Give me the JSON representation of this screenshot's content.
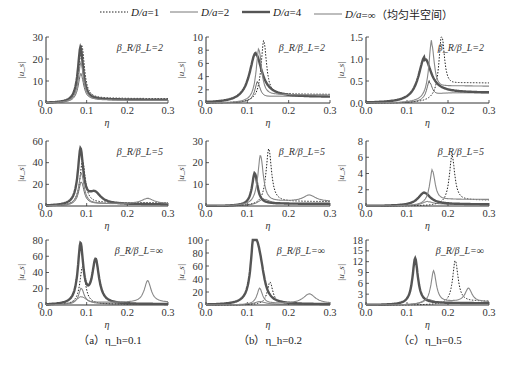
{
  "legend": [
    {
      "label_pre": "D/a",
      "label_post": "=1",
      "style": "dotted",
      "width": 1,
      "color": "#222222"
    },
    {
      "label_pre": "D/a",
      "label_post": "=2",
      "style": "solid",
      "width": 0.8,
      "color": "#555555"
    },
    {
      "label_pre": "D/a",
      "label_post": "=4",
      "style": "solid",
      "width": 2.4,
      "color": "#555555"
    },
    {
      "label_pre": "D/a",
      "label_post": "=∞（均匀半空间）",
      "style": "solid",
      "width": 1.1,
      "color": "#888888"
    }
  ],
  "captions": [
    "（a）η_h=0.1",
    "（b）η_h=0.2",
    "（c）η_h=0.5"
  ],
  "chart_data": [
    {
      "type": "line",
      "panel": "a-row1",
      "title": "β_R/β_L=2",
      "xlabel": "η",
      "ylabel": "|u_s|",
      "xlim": [
        0,
        0.3
      ],
      "ylim": [
        0,
        30
      ],
      "yticks": [
        0,
        10,
        20,
        30
      ],
      "xticks": [
        0.0,
        0.1,
        0.2,
        0.3
      ],
      "series": [
        {
          "name": "D/a=1",
          "peaks": [
            [
              0.088,
              26
            ]
          ],
          "tail": 2
        },
        {
          "name": "D/a=2",
          "peaks": [
            [
              0.086,
              13
            ]
          ],
          "tail": 1.5
        },
        {
          "name": "D/a=4",
          "peaks": [
            [
              0.085,
              25
            ]
          ],
          "tail": 1.5
        },
        {
          "name": "D/a=∞",
          "peaks": [
            [
              0.086,
              18
            ]
          ],
          "tail": 1.2
        }
      ]
    },
    {
      "type": "line",
      "panel": "b-row1",
      "title": "β_R/β_L=2",
      "xlabel": "η",
      "ylabel": "|u_s|",
      "xlim": [
        0,
        0.3
      ],
      "ylim": [
        0,
        10
      ],
      "yticks": [
        0,
        2,
        4,
        6,
        8,
        10
      ],
      "xticks": [
        0.0,
        0.1,
        0.2,
        0.3
      ],
      "series": [
        {
          "name": "D/a=1",
          "peaks": [
            [
              0.14,
              9.2
            ]
          ],
          "tail": 1.3
        },
        {
          "name": "D/a=2",
          "peaks": [
            [
              0.125,
              3.0
            ]
          ],
          "tail": 1.0
        },
        {
          "name": "D/a=4",
          "peaks": [
            [
              0.12,
              7.3
            ]
          ],
          "tail": 0.9
        },
        {
          "name": "D/a=∞",
          "peaks": [
            [
              0.128,
              8.0
            ]
          ],
          "tail": 1.2
        }
      ]
    },
    {
      "type": "line",
      "panel": "c-row1",
      "title": "β_R/β_L=2",
      "xlabel": "η",
      "ylabel": "|u_s|",
      "xlim": [
        0,
        0.3
      ],
      "ylim": [
        0,
        1.5
      ],
      "yticks": [
        0,
        0.5,
        1.0,
        1.5
      ],
      "xticks": [
        0.0,
        0.1,
        0.2,
        0.3
      ],
      "series": [
        {
          "name": "D/a=1",
          "peaks": [
            [
              0.185,
              1.48
            ]
          ],
          "tail": 0.45
        },
        {
          "name": "D/a=2",
          "peaks": [
            [
              0.155,
              0.45
            ]
          ],
          "tail": 0.23
        },
        {
          "name": "D/a=4",
          "peaks": [
            [
              0.143,
              0.98
            ]
          ],
          "tail": 0.23
        },
        {
          "name": "D/a=∞",
          "peaks": [
            [
              0.16,
              1.32
            ]
          ],
          "tail": 0.38
        }
      ]
    },
    {
      "type": "line",
      "panel": "a-row2",
      "title": "β_R/β_L=5",
      "xlabel": "η",
      "ylabel": "|u_s|",
      "xlim": [
        0,
        0.3
      ],
      "ylim": [
        0,
        60
      ],
      "yticks": [
        0,
        20,
        40,
        60
      ],
      "xticks": [
        0.0,
        0.1,
        0.2,
        0.3
      ],
      "series": [
        {
          "name": "D/a=1",
          "peaks": [
            [
              0.09,
              41
            ]
          ],
          "tail": 3
        },
        {
          "name": "D/a=2",
          "peaks": [
            [
              0.087,
              22
            ]
          ],
          "tail": 2
        },
        {
          "name": "D/a=4",
          "peaks": [
            [
              0.085,
              51
            ],
            [
              0.12,
              10
            ]
          ],
          "tail": 1.5
        },
        {
          "name": "D/a=∞",
          "peaks": [
            [
              0.087,
              30
            ],
            [
              0.25,
              5
            ]
          ],
          "tail": 2
        }
      ]
    },
    {
      "type": "line",
      "panel": "b-row2",
      "title": "β_R/β_L=5",
      "xlabel": "η",
      "ylabel": "|u_s|",
      "xlim": [
        0,
        0.3
      ],
      "ylim": [
        0,
        30
      ],
      "yticks": [
        0,
        10,
        20,
        30
      ],
      "xticks": [
        0.0,
        0.1,
        0.2,
        0.3
      ],
      "series": [
        {
          "name": "D/a=1",
          "peaks": [
            [
              0.152,
              26
            ]
          ],
          "tail": 2
        },
        {
          "name": "D/a=2",
          "peaks": [
            [
              0.14,
              3
            ]
          ],
          "tail": 1
        },
        {
          "name": "D/a=4",
          "peaks": [
            [
              0.118,
              15
            ]
          ],
          "tail": 1
        },
        {
          "name": "D/a=∞",
          "peaks": [
            [
              0.132,
              23
            ],
            [
              0.25,
              3
            ]
          ],
          "tail": 2
        }
      ]
    },
    {
      "type": "line",
      "panel": "c-row2",
      "title": "β_R/β_L=5",
      "xlabel": "η",
      "ylabel": "|u_s|",
      "xlim": [
        0,
        0.3
      ],
      "ylim": [
        0,
        8
      ],
      "yticks": [
        0,
        2,
        4,
        6,
        8
      ],
      "xticks": [
        0.0,
        0.1,
        0.2,
        0.3
      ],
      "series": [
        {
          "name": "D/a=1",
          "peaks": [
            [
              0.21,
              6.1
            ]
          ],
          "tail": 0.7
        },
        {
          "name": "D/a=2",
          "peaks": [
            [
              0.15,
              0.5
            ]
          ],
          "tail": 0.2
        },
        {
          "name": "D/a=4",
          "peaks": [
            [
              0.142,
              1.6
            ]
          ],
          "tail": 0.2
        },
        {
          "name": "D/a=∞",
          "peaks": [
            [
              0.162,
              4.3
            ]
          ],
          "tail": 0.8
        }
      ]
    },
    {
      "type": "line",
      "panel": "a-row3",
      "title": "β_R/β_L=∞",
      "xlabel": "η",
      "ylabel": "|u_s|",
      "xlim": [
        0,
        0.3
      ],
      "ylim": [
        0,
        80
      ],
      "yticks": [
        0,
        20,
        40,
        60,
        80
      ],
      "xticks": [
        0.0,
        0.1,
        0.2,
        0.3
      ],
      "series": [
        {
          "name": "D/a=1",
          "peaks": [
            [
              0.09,
              47
            ]
          ],
          "tail": 1
        },
        {
          "name": "D/a=2",
          "peaks": [
            [
              0.087,
              10
            ]
          ],
          "tail": 1
        },
        {
          "name": "D/a=4",
          "peaks": [
            [
              0.085,
              73
            ],
            [
              0.122,
              53
            ]
          ],
          "tail": 1
        },
        {
          "name": "D/a=∞",
          "peaks": [
            [
              0.087,
              20
            ],
            [
              0.25,
              27
            ]
          ],
          "tail": 3
        }
      ]
    },
    {
      "type": "line",
      "panel": "b-row3",
      "title": "β_R/β_L=∞",
      "xlabel": "η",
      "ylabel": "|u_s|",
      "xlim": [
        0,
        0.3
      ],
      "ylim": [
        0,
        100
      ],
      "yticks": [
        0,
        20,
        40,
        60,
        80,
        100
      ],
      "xticks": [
        0.0,
        0.1,
        0.2,
        0.3
      ],
      "series": [
        {
          "name": "D/a=1",
          "peaks": [
            [
              0.155,
              35
            ]
          ],
          "tail": 2
        },
        {
          "name": "D/a=2",
          "peaks": [
            [
              0.13,
              5
            ]
          ],
          "tail": 1
        },
        {
          "name": "D/a=4",
          "peaks": [
            [
              0.115,
              79
            ],
            [
              0.125,
              42
            ],
            [
              0.133,
              33
            ]
          ],
          "tail": 1
        },
        {
          "name": "D/a=∞",
          "peaks": [
            [
              0.13,
              25
            ],
            [
              0.25,
              15
            ]
          ],
          "tail": 2
        }
      ]
    },
    {
      "type": "line",
      "panel": "c-row3",
      "title": "β_R/β_L=∞",
      "xlabel": "η",
      "ylabel": "|u_s|",
      "xlim": [
        0,
        0.3
      ],
      "ylim": [
        0,
        18
      ],
      "yticks": [
        0,
        3,
        6,
        9,
        12,
        15,
        18
      ],
      "xticks": [
        0.0,
        0.1,
        0.2,
        0.3
      ],
      "series": [
        {
          "name": "D/a=1",
          "peaks": [
            [
              0.218,
              12.2
            ]
          ],
          "tail": 1
        },
        {
          "name": "D/a=2",
          "peaks": [
            [
              0.15,
              1.5
            ]
          ],
          "tail": 0.5
        },
        {
          "name": "D/a=4",
          "peaks": [
            [
              0.12,
              12.8
            ]
          ],
          "tail": 0.5
        },
        {
          "name": "D/a=∞",
          "peaks": [
            [
              0.165,
              9.2
            ],
            [
              0.25,
              3.8
            ]
          ],
          "tail": 0.8
        }
      ]
    }
  ],
  "panel_layout": {
    "col_x0": [
      46,
      206,
      366
    ],
    "col_x1": [
      168,
      330,
      489
    ],
    "row_ytop": [
      37,
      141,
      240
    ],
    "row_ybot": [
      103,
      206,
      305
    ]
  }
}
